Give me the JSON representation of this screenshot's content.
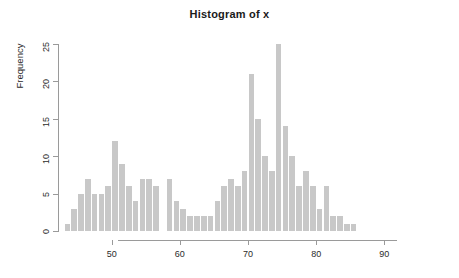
{
  "chart_data": {
    "type": "bar",
    "title": "Histogram of x",
    "xlabel": "",
    "ylabel": "Frequency",
    "bin_width": 1,
    "xlim": [
      43,
      96
    ],
    "ylim": [
      0,
      25
    ],
    "grid": false,
    "legend": null,
    "bar_color": "#c8c8c8",
    "axis_color": "#9a9a9a",
    "x_ticks": [
      50,
      60,
      70,
      80,
      90
    ],
    "y_ticks": [
      0,
      5,
      10,
      15,
      20,
      25
    ],
    "categories": [
      43,
      44,
      45,
      46,
      47,
      48,
      49,
      50,
      51,
      52,
      53,
      54,
      55,
      56,
      57,
      58,
      59,
      60,
      61,
      62,
      63,
      64,
      65,
      66,
      67,
      68,
      69,
      70,
      71,
      72,
      73,
      74,
      75,
      76,
      77,
      78,
      79,
      80,
      81,
      82,
      83,
      84,
      85,
      86,
      87,
      88,
      89,
      90,
      91,
      92,
      93,
      94,
      95
    ],
    "values": [
      1,
      3,
      5,
      7,
      5,
      5,
      6,
      12,
      9,
      6,
      4,
      7,
      7,
      6,
      0,
      7,
      4,
      3,
      2,
      2,
      2,
      2,
      4,
      6,
      7,
      6,
      8,
      21,
      15,
      10,
      8,
      25,
      14,
      10,
      6,
      8,
      6,
      3,
      6,
      2,
      2,
      1,
      1,
      0,
      0,
      0,
      0,
      0,
      0,
      0,
      0,
      0,
      0
    ],
    "bars": [
      {
        "x": 43,
        "value": 1
      },
      {
        "x": 44,
        "value": 3
      },
      {
        "x": 45,
        "value": 5
      },
      {
        "x": 46,
        "value": 7
      },
      {
        "x": 47,
        "value": 5
      },
      {
        "x": 48,
        "value": 5
      },
      {
        "x": 49,
        "value": 6
      },
      {
        "x": 50,
        "value": 12
      },
      {
        "x": 51,
        "value": 9
      },
      {
        "x": 52,
        "value": 6
      },
      {
        "x": 53,
        "value": 4
      },
      {
        "x": 54,
        "value": 7
      },
      {
        "x": 55,
        "value": 7
      },
      {
        "x": 56,
        "value": 6
      },
      {
        "x": 58,
        "value": 7
      },
      {
        "x": 59,
        "value": 4
      },
      {
        "x": 60,
        "value": 3
      },
      {
        "x": 61,
        "value": 2
      },
      {
        "x": 62,
        "value": 2
      },
      {
        "x": 63,
        "value": 2
      },
      {
        "x": 64,
        "value": 2
      },
      {
        "x": 65,
        "value": 4
      },
      {
        "x": 66,
        "value": 6
      },
      {
        "x": 67,
        "value": 7
      },
      {
        "x": 68,
        "value": 6
      },
      {
        "x": 69,
        "value": 8
      },
      {
        "x": 70,
        "value": 21
      },
      {
        "x": 71,
        "value": 15
      },
      {
        "x": 72,
        "value": 10
      },
      {
        "x": 73,
        "value": 8
      },
      {
        "x": 74,
        "value": 25
      },
      {
        "x": 75,
        "value": 14
      },
      {
        "x": 76,
        "value": 10
      },
      {
        "x": 77,
        "value": 6
      },
      {
        "x": 78,
        "value": 8
      },
      {
        "x": 79,
        "value": 6
      },
      {
        "x": 80,
        "value": 3
      },
      {
        "x": 81,
        "value": 6
      },
      {
        "x": 82,
        "value": 2
      },
      {
        "x": 83,
        "value": 2
      },
      {
        "x": 84,
        "value": 1
      },
      {
        "x": 85,
        "value": 1
      }
    ]
  },
  "axes": {
    "y_tick_labels": [
      "0",
      "5",
      "10",
      "15",
      "20",
      "25"
    ],
    "x_tick_labels": [
      "50",
      "60",
      "70",
      "80",
      "90"
    ],
    "y_axis_title": "Frequency"
  },
  "header": {
    "title": "Histogram of x"
  }
}
